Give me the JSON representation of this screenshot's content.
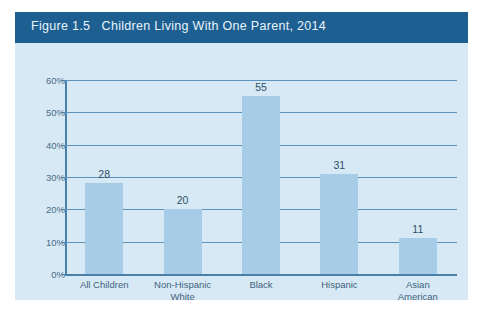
{
  "figure": {
    "title": "Figure 1.5   Children Living With One Parent, 2014",
    "title_bar_color": "#1d5f91",
    "panel_background": "#d7e9f5"
  },
  "chart_data": {
    "type": "bar",
    "title": "Figure 1.5   Children Living With One Parent, 2014",
    "categories": [
      "All Children",
      "Non-Hispanic White",
      "Black",
      "Hispanic",
      "Asian American"
    ],
    "category_lines": [
      [
        "All Children",
        ""
      ],
      [
        "Non-Hispanic",
        "White"
      ],
      [
        "Black",
        ""
      ],
      [
        "Hispanic",
        ""
      ],
      [
        "Asian",
        "American"
      ]
    ],
    "values": [
      28,
      20,
      55,
      31,
      11
    ],
    "value_labels": [
      "28",
      "20",
      "55",
      "31",
      "11"
    ],
    "xlabel": "",
    "ylabel": "",
    "ylim": [
      0,
      60
    ],
    "yticks": [
      0,
      10,
      20,
      30,
      40,
      50,
      60
    ],
    "ytick_labels": [
      "0%",
      "10%",
      "20%",
      "30%",
      "40%",
      "50%",
      "60%"
    ],
    "grid": true,
    "legend": false,
    "bar_color": "#a7cce8",
    "gridline_color": "#5b93bf",
    "axis_color": "#4a7fa8"
  }
}
